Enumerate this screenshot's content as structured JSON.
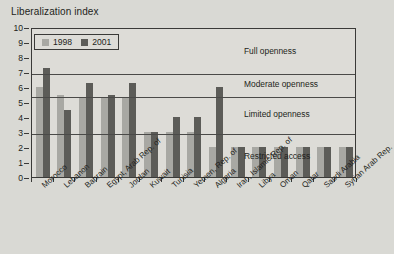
{
  "chart_data": {
    "type": "bar",
    "title": "Liberalization index",
    "xlabel": "",
    "ylabel": "Liberalization index",
    "ylim": [
      0,
      10
    ],
    "ytick_labels": [
      "0",
      "1",
      "2",
      "3",
      "4",
      "5",
      "6",
      "7",
      "8",
      "9",
      "10"
    ],
    "grid": true,
    "gridlines": [
      3,
      5.5,
      7
    ],
    "legend_position": "top-left",
    "categories": [
      "Morocco",
      "Lebanon",
      "Bahrain",
      "Egypt, Arab Rep. of",
      "Jordan",
      "Kuwait",
      "Tunisia",
      "Yemen, Rep. of",
      "Algeria",
      "Iran, Islamic Rep. of",
      "Libya",
      "Oman",
      "Qatar",
      "Saudi Arabia",
      "Syrian Arab Rep."
    ],
    "series": [
      {
        "name": "1998",
        "color": "#a8a8a3",
        "values": [
          6,
          5.5,
          5.3,
          5.3,
          5.3,
          3,
          3,
          3,
          2,
          2,
          2,
          2,
          2,
          2,
          2
        ]
      },
      {
        "name": "2001",
        "color": "#5c5c58",
        "values": [
          7.3,
          4.5,
          6.3,
          5.5,
          6.3,
          3,
          4,
          4,
          6,
          2,
          2,
          2,
          2,
          2,
          2
        ]
      }
    ],
    "zones": [
      {
        "label": "Full openness",
        "from": 7,
        "to": 10
      },
      {
        "label": "Moderate openness",
        "from": 5.5,
        "to": 7
      },
      {
        "label": "Limited openness",
        "from": 3,
        "to": 5.5
      },
      {
        "label": "Restricted access",
        "from": 0,
        "to": 3
      }
    ]
  }
}
